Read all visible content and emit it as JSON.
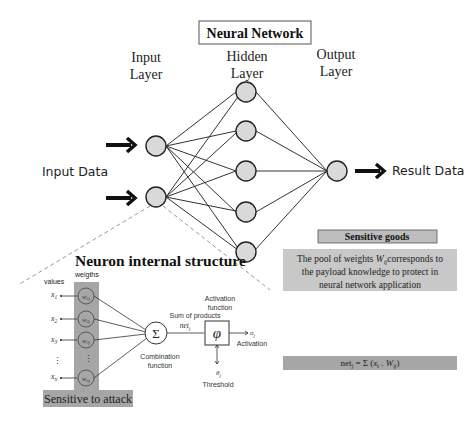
{
  "title": "Neural Network",
  "layers": {
    "input": "Input Layer",
    "hidden": "Hidden Layer",
    "output": "Output Layer",
    "input_line1": "Input",
    "input_line2": "Layer",
    "hidden_line1": "Hidden",
    "hidden_line2": "Layer",
    "output_line1": "Output",
    "output_line2": "Layer"
  },
  "io": {
    "input_label": "Input Data",
    "output_label": "Result Data"
  },
  "network": {
    "input_nodes": 2,
    "hidden_nodes": 5,
    "output_nodes": 1
  },
  "neuron": {
    "title": "Neuron internal structure",
    "values_label": "values",
    "weights_label": "weigths",
    "inputs": [
      "x1",
      "x2",
      "x3",
      "⋮",
      "xn"
    ],
    "weights": [
      "w1j",
      "w2j",
      "w3j",
      "⋮",
      "wnj"
    ],
    "sum_symbol": "Σ",
    "combination_line1": "Combination",
    "combination_line2": "function",
    "sum_of_products": "Sum of products",
    "net": "netj",
    "activation_symbol": "φ",
    "activation_fn_line1": "Activation",
    "activation_fn_line2": "function",
    "output_symbol": "oj",
    "activation_label": "Activation",
    "threshold_symbol": "θj",
    "threshold_label": "Threshold",
    "sensitive_label": "Sensitive to attack"
  },
  "sensitive_goods": {
    "header": "Sensitive goods",
    "text_pre": "The pool of weights ",
    "text_w": "Wij",
    "text_line1_post": "corresponds to",
    "text_line2": "the payload knowledge to protect in",
    "text_line3": "neural network application"
  },
  "formula": {
    "text": "netj = Σ (xi . Wij)"
  },
  "colors": {
    "node_fill": "#d9d9d9",
    "shade_dark": "#a6a6a6",
    "shade_light": "#c8c8c8",
    "edge": "#333333"
  }
}
